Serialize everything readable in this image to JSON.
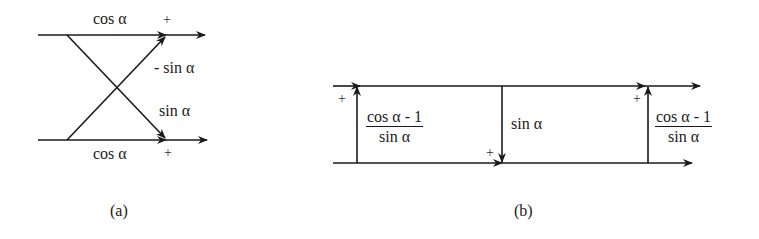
{
  "diagram": {
    "a": {
      "caption": "(a)",
      "top_label": "cos α",
      "bottom_label": "cos α",
      "diag_up_label": "- sin α",
      "diag_down_label": "sin α",
      "plus_top": "+",
      "plus_bottom": "+"
    },
    "b": {
      "caption": "(b)",
      "left_num": "cos α - 1",
      "left_den": "sin α",
      "mid_label": "sin α",
      "right_num": "cos α - 1",
      "right_den": "sin α",
      "plus_left": "+",
      "plus_mid": "+",
      "plus_right": "+"
    }
  }
}
